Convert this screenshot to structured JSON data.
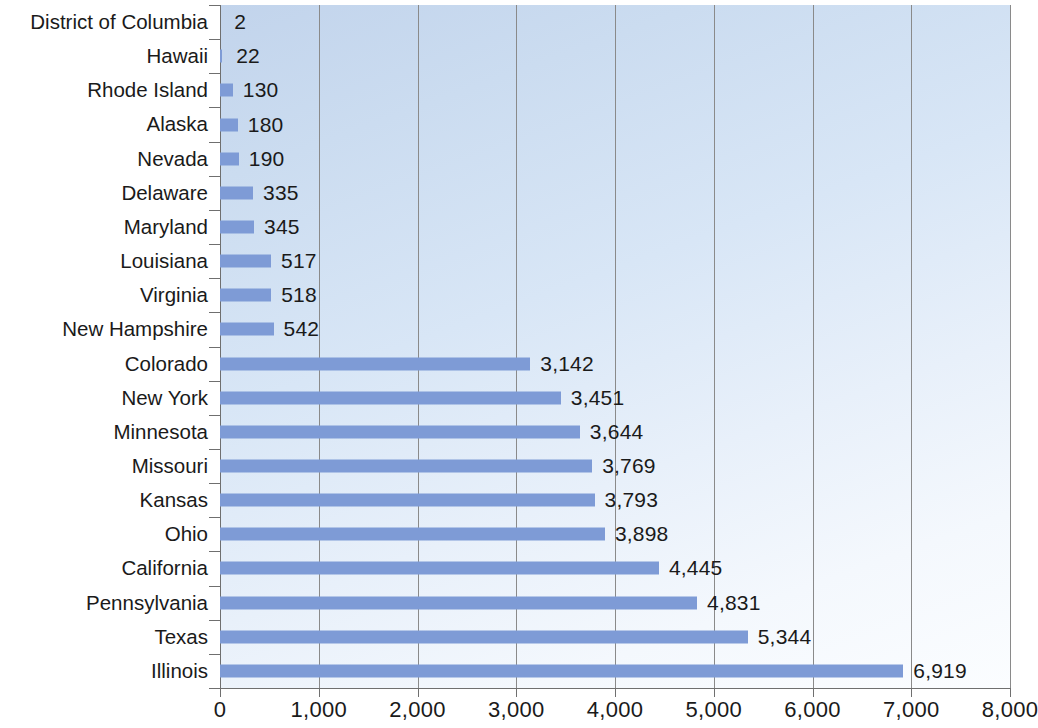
{
  "chart_data": {
    "type": "bar",
    "orientation": "horizontal",
    "title": "",
    "subtitle": "",
    "xlabel": "",
    "ylabel": "",
    "xlim": [
      0,
      8000
    ],
    "xticks": [
      0,
      1000,
      2000,
      3000,
      4000,
      5000,
      6000,
      7000,
      8000
    ],
    "xtick_labels": [
      "0",
      "1,000",
      "2,000",
      "3,000",
      "4,000",
      "5,000",
      "6,000",
      "7,000",
      "8,000"
    ],
    "grid": "vertical",
    "legend": null,
    "bar_color": "#7e9bd6",
    "plot_background": "light blue diagonal gradient",
    "categories": [
      "District of Columbia",
      "Hawaii",
      "Rhode Island",
      "Alaska",
      "Nevada",
      "Delaware",
      "Maryland",
      "Louisiana",
      "Virginia",
      "New Hampshire",
      "Colorado",
      "New York",
      "Minnesota",
      "Missouri",
      "Kansas",
      "Ohio",
      "California",
      "Pennsylvania",
      "Texas",
      "Illinois"
    ],
    "values": [
      2,
      22,
      130,
      180,
      190,
      335,
      345,
      517,
      518,
      542,
      3142,
      3451,
      3644,
      3769,
      3793,
      3898,
      4445,
      4831,
      5344,
      6919
    ],
    "value_labels": [
      "2",
      "22",
      "130",
      "180",
      "190",
      "335",
      "345",
      "517",
      "518",
      "542",
      "3,142",
      "3,451",
      "3,644",
      "3,769",
      "3,793",
      "3,898",
      "4,445",
      "4,831",
      "5,344",
      "6,919"
    ]
  }
}
